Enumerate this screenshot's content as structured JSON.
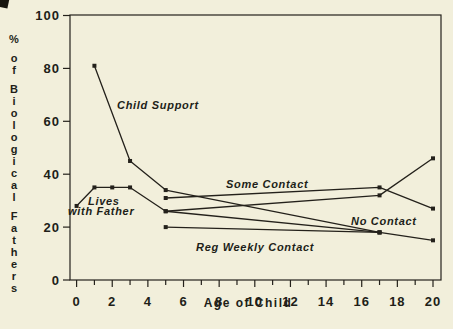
{
  "figure": {
    "background_color": "#f2efdb",
    "ink_color": "#24211b"
  },
  "chart_data": {
    "type": "line",
    "title": "",
    "xlabel": "Age of Child",
    "ylabel": "% of Biological Fathers",
    "ylabel_words": [
      "%",
      "of",
      "Biological",
      "Fathers"
    ],
    "xlim": [
      0,
      20
    ],
    "ylim": [
      0,
      100
    ],
    "grid": false,
    "x_major_ticks": [
      0,
      2,
      4,
      6,
      8,
      10,
      12,
      14,
      16,
      18,
      20
    ],
    "x_minor_tick_step": 1,
    "y_ticks": [
      0,
      20,
      40,
      60,
      80,
      100
    ],
    "series": [
      {
        "name": "Child Support",
        "points": [
          [
            1,
            81
          ],
          [
            3,
            45
          ],
          [
            5,
            34
          ],
          [
            17,
            18
          ],
          [
            20,
            15
          ]
        ]
      },
      {
        "name": "Lives with Father",
        "points": [
          [
            0,
            28
          ],
          [
            1,
            35
          ],
          [
            2,
            35
          ],
          [
            3,
            35
          ],
          [
            5,
            26
          ],
          [
            17,
            18
          ]
        ]
      },
      {
        "name": "Some Contact",
        "points": [
          [
            5,
            31
          ],
          [
            17,
            35
          ],
          [
            20,
            27
          ]
        ]
      },
      {
        "name": "No Contact",
        "points": [
          [
            5,
            26
          ],
          [
            17,
            32
          ],
          [
            20,
            46
          ]
        ]
      },
      {
        "name": "Reg Weekly Contact",
        "points": [
          [
            5,
            20
          ],
          [
            17,
            18
          ]
        ]
      }
    ],
    "annotations": [
      {
        "text": "Child Support",
        "x": 117,
        "y": 99
      },
      {
        "text": "Lives",
        "x": 88,
        "y": 195
      },
      {
        "text": "with Father",
        "x": 68,
        "y": 205
      },
      {
        "text": "Some Contact",
        "x": 226,
        "y": 178
      },
      {
        "text": "No Contact",
        "x": 351,
        "y": 215
      },
      {
        "text": "Reg Weekly Contact",
        "x": 196,
        "y": 241
      }
    ],
    "legend_position": "none",
    "marker": "square"
  }
}
